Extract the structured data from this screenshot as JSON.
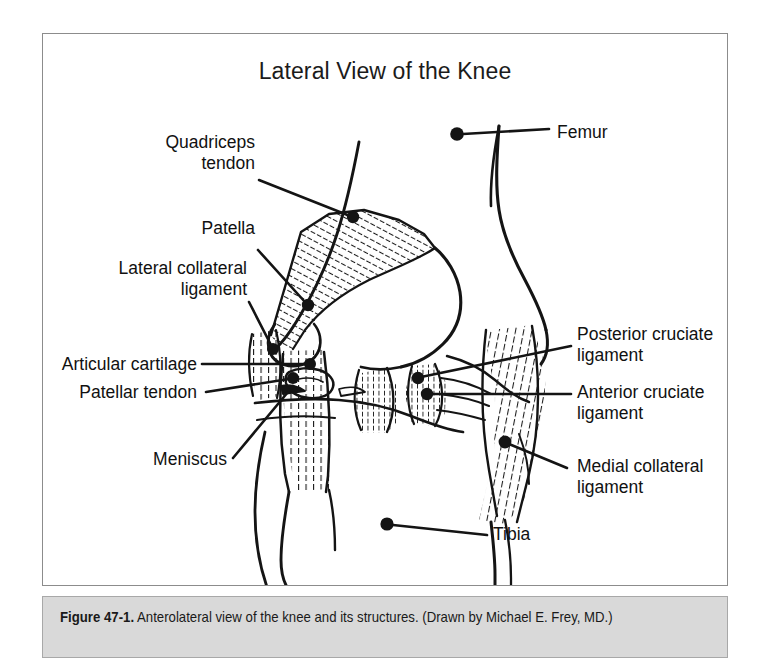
{
  "figure": {
    "title": "Lateral View of the Knee",
    "caption_bold": "Figure 47-1.",
    "caption_rest": " Anterolateral view of the knee and its structures. (Drawn by Michael E. Frey, MD.)"
  },
  "labels": {
    "quadriceps_tendon": "Quadriceps\ntendon",
    "patella": "Patella",
    "lateral_collateral_ligament": "Lateral collateral\nligament",
    "articular_cartilage": "Articular cartilage",
    "patellar_tendon": "Patellar tendon",
    "meniscus": "Meniscus",
    "femur": "Femur",
    "posterior_cruciate_ligament": "Posterior cruciate\nligament",
    "anterior_cruciate_ligament": "Anterior cruciate\nligament",
    "medial_collateral_ligament": "Medial collateral\nligament",
    "tibia": "Tibia"
  },
  "colors": {
    "ink": "#111111",
    "frame": "#8c8c8c",
    "caption_bg": "#d9d9d9",
    "page_bg": "#ffffff"
  }
}
